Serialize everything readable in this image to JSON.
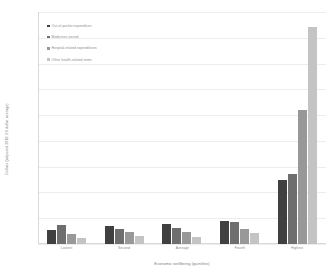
{
  "chart_data": {
    "type": "bar",
    "title": "",
    "xlabel": "Economic wellbeing (quintiles)",
    "ylabel": "Dollars (adjusted 2018 US dollar average)",
    "categories": [
      "Lowest",
      "Second",
      "Average",
      "Fourth",
      "Highest"
    ],
    "ylim": [
      0,
      900
    ],
    "yticks": [
      0,
      100,
      200,
      300,
      400,
      500,
      600,
      700,
      800,
      900
    ],
    "ytick_labels": [
      "0",
      "100",
      "200",
      "300",
      "400",
      "500",
      "600",
      "700",
      "800",
      "900"
    ],
    "grid": true,
    "legend_position": "upper-left",
    "series": [
      {
        "name": "Out-of-pocket expenditure",
        "color": "#404040",
        "values": [
          55,
          68,
          79,
          88,
          250
        ]
      },
      {
        "name": "Medicines served",
        "color": "#6e6e6e",
        "values": [
          72,
          58,
          64,
          84,
          272
        ]
      },
      {
        "name": "Hospital-related expenditures",
        "color": "#989898",
        "values": [
          40,
          45,
          45,
          57,
          520
        ]
      },
      {
        "name": "Other health-related items",
        "color": "#c4c4c4",
        "values": [
          25,
          32,
          26,
          44,
          840
        ]
      }
    ]
  }
}
